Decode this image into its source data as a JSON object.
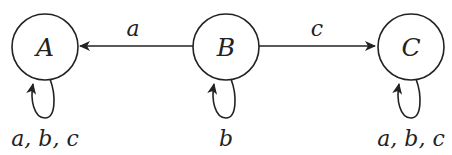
{
  "diagram": {
    "type": "finite-automaton",
    "states": [
      {
        "id": "A",
        "label": "A",
        "cx": 45,
        "cy": 47,
        "r": 33,
        "self_loop_label": "a, b, c"
      },
      {
        "id": "B",
        "label": "B",
        "cx": 226,
        "cy": 47,
        "r": 33,
        "self_loop_label": "b"
      },
      {
        "id": "C",
        "label": "C",
        "cx": 411,
        "cy": 47,
        "r": 33,
        "self_loop_label": "a, b, c"
      }
    ],
    "transitions": [
      {
        "from": "B",
        "to": "A",
        "label": "a"
      },
      {
        "from": "B",
        "to": "C",
        "label": "c"
      },
      {
        "from": "A",
        "to": "A",
        "label": "a, b, c"
      },
      {
        "from": "B",
        "to": "B",
        "label": "b"
      },
      {
        "from": "C",
        "to": "C",
        "label": "a, b, c"
      }
    ],
    "colors": {
      "stroke": "#222222",
      "background": "#ffffff"
    }
  }
}
